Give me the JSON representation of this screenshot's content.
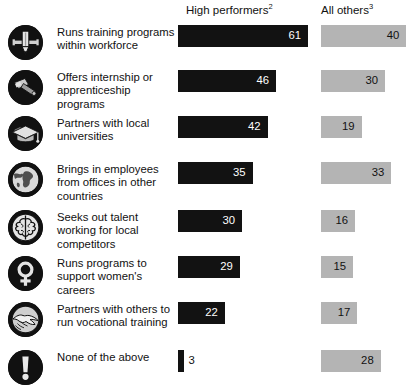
{
  "header": {
    "col_high_label": "High performers",
    "col_high_footnote": "2",
    "col_all_label": "All others",
    "col_all_footnote": "3"
  },
  "colors": {
    "high_performers_bar": "#121212",
    "all_others_bar": "#b4b4b4",
    "icon_badge": "#111111",
    "text": "#111111",
    "background": "#ffffff"
  },
  "chart_data": {
    "type": "bar",
    "title": "",
    "subtitle": "",
    "xlabel": "",
    "ylabel": "",
    "grid": false,
    "legend_position": "top",
    "orientation": "horizontal",
    "value_unit": "percent",
    "xlim": [
      0,
      61
    ],
    "categories": [
      "Runs training programs within workforce",
      "Offers internship or apprenticeship programs",
      "Partners with local universities",
      "Brings in employees from offices in other countries",
      "Seeks out talent working for local competitors",
      "Runs programs to support women's careers",
      "Partners with others to run vocational training",
      "None of the above"
    ],
    "series": [
      {
        "name": "High performers",
        "values": [
          61,
          46,
          42,
          35,
          30,
          29,
          22,
          3
        ]
      },
      {
        "name": "All others",
        "values": [
          40,
          30,
          19,
          33,
          16,
          15,
          17,
          28
        ]
      }
    ]
  },
  "rows": [
    {
      "icon": "pencil-icon",
      "label_lines": [
        "Runs training programs",
        "within workforce"
      ],
      "high": 61,
      "all": 40
    },
    {
      "icon": "hammer-icon",
      "label_lines": [
        "Offers internship or",
        "apprenticeship programs"
      ],
      "high": 46,
      "all": 30
    },
    {
      "icon": "graduation-cap-icon",
      "label_lines": [
        "Partners with local",
        "universities"
      ],
      "high": 42,
      "all": 19
    },
    {
      "icon": "globe-icon",
      "label_lines": [
        "Brings in employees",
        "from offices in other",
        "countries"
      ],
      "high": 35,
      "all": 33
    },
    {
      "icon": "brain-icon",
      "label_lines": [
        "Seeks out talent",
        "working for local",
        "competitors"
      ],
      "high": 30,
      "all": 16
    },
    {
      "icon": "female-symbol-icon",
      "label_lines": [
        "Runs programs to",
        "support women's",
        "careers"
      ],
      "high": 29,
      "all": 15
    },
    {
      "icon": "handshake-icon",
      "label_lines": [
        "Partners with others to",
        "run vocational training"
      ],
      "high": 22,
      "all": 17
    },
    {
      "icon": "exclamation-mark-icon",
      "label_lines": [
        "None of the above"
      ],
      "high": 3,
      "all": 28
    }
  ]
}
